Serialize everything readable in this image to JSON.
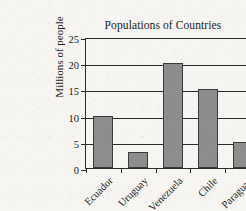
{
  "chart_data": {
    "type": "bar",
    "title": "Populations of Countries",
    "xlabel": "",
    "ylabel": "Millions of people",
    "categories": [
      "Ecuador",
      "Uruguay",
      "Venezuela",
      "Chile",
      "Paraguay"
    ],
    "values": [
      10,
      3,
      20,
      15,
      5
    ],
    "ylim": [
      0,
      25
    ],
    "ytick_step": 5,
    "yticks": [
      0,
      5,
      10,
      15,
      20,
      25
    ],
    "ytick_labels": [
      "0",
      "5",
      "10",
      "15",
      "20",
      "25"
    ],
    "grid": "horizontal",
    "legend": "none",
    "bar_color": "#8d8d8d",
    "bar_edge_color": "#3a3a3a",
    "axis_color": "#2b2b2b",
    "background_color": "#f6f5f2",
    "xtick_label_rotation": -45
  }
}
